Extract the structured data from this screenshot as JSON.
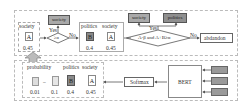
{
  "top": {
    "left_group": {
      "word": "society",
      "letter": "A",
      "value": "0.45"
    },
    "decision1": {
      "condition": "≥α",
      "yes": "Yes",
      "no": "No",
      "yes_target": "society"
    },
    "middle_group": {
      "items": [
        {
          "word": "politics",
          "letter": "B",
          "value": "0.4"
        },
        {
          "word": "society",
          "letter": "A",
          "value": "0.45"
        }
      ]
    },
    "decision2": {
      "condition": "A-β and A+B≥α",
      "yes": "Yes",
      "no": "No",
      "yes_targets": [
        "society",
        "politics"
      ],
      "no_target": "abdandon"
    }
  },
  "bottom": {
    "probability_label": "probability",
    "items": [
      {
        "word": "",
        "letter": "",
        "value": "0.01"
      },
      {
        "word": "",
        "letter": "",
        "value": "0.1"
      },
      {
        "word": "politics",
        "letter": "B",
        "value": "0.4"
      },
      {
        "word": "society",
        "letter": "A",
        "value": "0.45"
      }
    ],
    "ellipsis": "–",
    "softmax": "Softmax",
    "bert": "BERT"
  },
  "colors": {
    "dashed_border": "#bbbbbb",
    "box_gray": "#9a9a9a",
    "arrow": "#555555"
  }
}
